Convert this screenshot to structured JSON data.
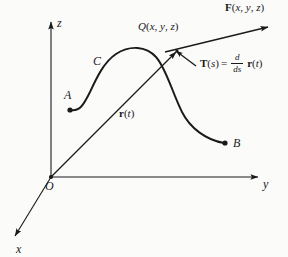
{
  "figure": {
    "kind": "3d-vector-calculus-diagram",
    "background_color": "#fbfbfa",
    "ink_color": "#1a1a1a",
    "axes": {
      "z_label": "z",
      "y_label": "y",
      "x_label": "x",
      "origin_label": "O"
    },
    "curve": {
      "name_label": "C",
      "start_point_label": "A",
      "end_point_label": "B"
    },
    "point_q": {
      "name": "Q",
      "open_paren": "(",
      "coord_x": "x",
      "comma_1": ", ",
      "coord_y": "y",
      "comma_2": ", ",
      "coord_z": "z",
      "close_paren": ")",
      "full_label": "Q(x, y, z)"
    },
    "vector_f": {
      "symbol": "F",
      "open_paren": "(",
      "coord_x": "x",
      "comma_1": ", ",
      "coord_y": "y",
      "comma_2": ", ",
      "coord_z": "z",
      "close_paren": ")",
      "full_label": "F(x, y, z)"
    },
    "vector_r": {
      "symbol": "r",
      "open_paren": "(",
      "param": "t",
      "close_paren": ")",
      "full_label": "r(t)"
    },
    "vector_t": {
      "symbol": "T",
      "open_paren": "(",
      "param": "s",
      "close_paren": ")",
      "equals": "=",
      "derivative_numerator": "d",
      "derivative_denominator": "ds",
      "operand_symbol": "r",
      "operand_open_paren": "(",
      "operand_param": "t",
      "operand_close_paren": ")",
      "full_label": "T(s) = d/ds r(t)"
    }
  }
}
